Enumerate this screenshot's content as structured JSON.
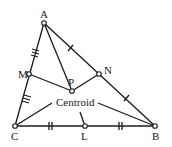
{
  "diagram": {
    "vertices": {
      "A": {
        "label": "A",
        "x": 44,
        "y": 23
      },
      "B": {
        "label": "B",
        "x": 155,
        "y": 126
      },
      "C": {
        "label": "C",
        "x": 15,
        "y": 126
      }
    },
    "midpoints": {
      "M": {
        "label": "M",
        "x": 29,
        "y": 74
      },
      "N": {
        "label": "N",
        "x": 99,
        "y": 74
      },
      "L": {
        "label": "L",
        "x": 85,
        "y": 126
      }
    },
    "centroid": {
      "label": "P",
      "x": 72,
      "y": 91
    },
    "annotation": "Centroid",
    "colors": {
      "stroke": "#1a1a1a",
      "background": "#ffffff"
    }
  }
}
